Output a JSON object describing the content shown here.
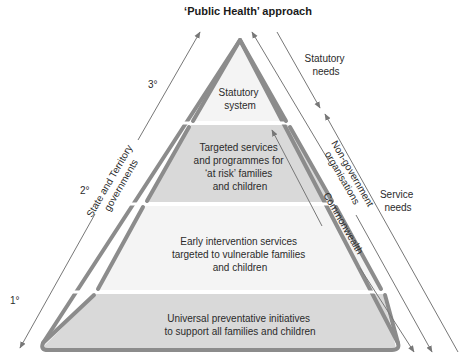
{
  "title": "‘Public Health’ approach",
  "colors": {
    "pyramid_border": "#8c8c8c",
    "tier_light": "#f4f4f4",
    "tier_dark": "#d9d9d9",
    "arrow": "#777777",
    "text": "#2b2b2b"
  },
  "levels": {
    "tertiary": "3°",
    "secondary": "2°",
    "primary": "1°"
  },
  "tiers": [
    {
      "name": "statutory",
      "lines": [
        "Statutory",
        "system"
      ]
    },
    {
      "name": "targeted",
      "lines": [
        "Targeted services",
        "and programmes for",
        "‘at risk’ families",
        "and children"
      ]
    },
    {
      "name": "early-intervention",
      "lines": [
        "Early intervention services",
        "targeted to vulnerable families",
        "and children"
      ]
    },
    {
      "name": "universal",
      "lines": [
        "Universal preventative initiatives",
        "to support all families and children"
      ]
    }
  ],
  "left_arrow": {
    "lines": [
      "State and Territory",
      "governments"
    ]
  },
  "right_arrows": {
    "ngo": [
      "Non-government",
      "organisations"
    ],
    "commonwealth": "Commonwealth",
    "statutory_needs": [
      "Statutory",
      "needs"
    ],
    "service_needs": [
      "Service",
      "needs"
    ]
  }
}
